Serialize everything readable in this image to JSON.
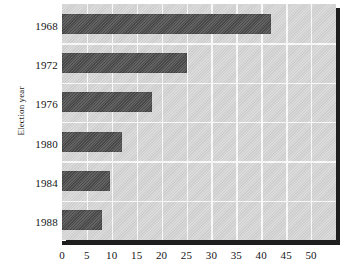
{
  "chart_data": {
    "type": "bar",
    "orientation": "horizontal",
    "title": "",
    "subtitle": "",
    "xlabel": "",
    "ylabel": "Election year",
    "categories": [
      "1968",
      "1972",
      "1976",
      "1980",
      "1984",
      "1988"
    ],
    "values": [
      42,
      25,
      18,
      12,
      9.7,
      8
    ],
    "series": [
      {
        "name": "",
        "values": [
          42,
          25,
          18,
          12,
          9.7,
          8
        ]
      }
    ],
    "xlim": [
      0,
      55
    ],
    "xticks": [
      0,
      5,
      10,
      15,
      20,
      25,
      30,
      35,
      40,
      45,
      50
    ],
    "xticklabels": [
      "0",
      "5",
      "10",
      "15",
      "20",
      "25",
      "30",
      "35",
      "40",
      "45",
      "50"
    ],
    "grid": true,
    "grid_axis": "both",
    "legend": false,
    "legend_position": "none",
    "annotations": []
  },
  "style": {
    "bar_color": "#4c4c4c",
    "plot_background": "#d6d6d6",
    "gridline_color": "#fbfbfb",
    "axis_color": "#1e1e1e",
    "text_color": "#141414",
    "page_background": "#ffffff"
  }
}
